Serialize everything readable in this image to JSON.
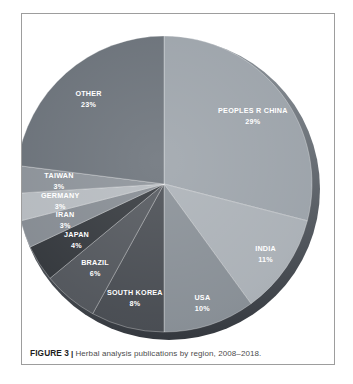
{
  "figure": {
    "caption_label": "FIGURE 3",
    "caption_separator": "|",
    "caption_text": "Herbal analysis publications by region, 2008–2018."
  },
  "chart_data": {
    "type": "pie",
    "title": "Herbal analysis publications by region, 2008–2018",
    "unit": "%",
    "direction": "clockwise",
    "start_angle_deg": 0,
    "legend": "none",
    "label_color": "#ffffff",
    "rim_gradient_top": "#8d949b",
    "rim_gradient_bottom": "#34383e",
    "categories": [
      "PEOPLES R CHINA",
      "INDIA",
      "USA",
      "SOUTH KOREA",
      "BRAZIL",
      "JAPAN",
      "IRAN",
      "GERMANY",
      "TAIWAN",
      "OTHER"
    ],
    "values": [
      29,
      11,
      10,
      8,
      6,
      4,
      3,
      3,
      3,
      23
    ],
    "slices": [
      {
        "label": "PEOPLES R CHINA",
        "value": 29,
        "display": "29%",
        "color": "#9aa1a8",
        "label_r": 0.76
      },
      {
        "label": "INDIA",
        "value": 11,
        "display": "11%",
        "color": "#a9afb5",
        "label_r": 0.83
      },
      {
        "label": "USA",
        "value": 10,
        "display": "10%",
        "color": "#858c93",
        "label_r": 0.84
      },
      {
        "label": "SOUTH KOREA",
        "value": 8,
        "display": "8%",
        "color": "#44484e",
        "label_r": 0.79
      },
      {
        "label": "BRAZIL",
        "value": 6,
        "display": "6%",
        "color": "#4e5258",
        "label_r": 0.73
      },
      {
        "label": "JAPAN",
        "value": 4,
        "display": "4%",
        "color": "#2f3338",
        "label_r": 0.7
      },
      {
        "label": "IRAN",
        "value": 3,
        "display": "3%",
        "color": "#82888f",
        "label_r": 0.71
      },
      {
        "label": "GERMANY",
        "value": 3,
        "display": "3%",
        "color": "#b3b8bd",
        "label_r": 0.71
      },
      {
        "label": "TAIWAN",
        "value": 3,
        "display": "3%",
        "color": "#888e95",
        "label_r": 0.71
      },
      {
        "label": "OTHER",
        "value": 23,
        "display": "23%",
        "color": "#666d75",
        "label_r": 0.77
      }
    ]
  }
}
